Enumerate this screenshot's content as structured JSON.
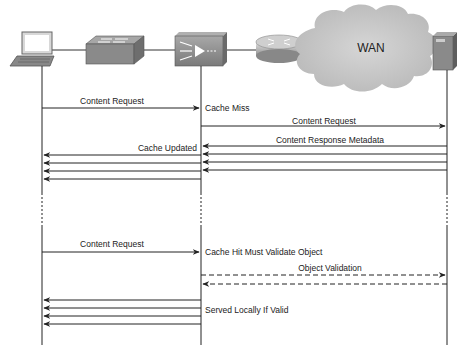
{
  "diagram": {
    "title": "",
    "devices": [
      {
        "id": "laptop",
        "type": "laptop",
        "label": ""
      },
      {
        "id": "switch",
        "type": "switch",
        "label": ""
      },
      {
        "id": "cache-engine",
        "type": "content-engine",
        "label": ""
      },
      {
        "id": "router",
        "type": "router",
        "label": ""
      },
      {
        "id": "wan",
        "type": "cloud",
        "label": "WAN"
      },
      {
        "id": "server",
        "type": "server",
        "label": ""
      }
    ],
    "messages": {
      "m1": "Content Request",
      "m1_note": "Cache Miss",
      "m2": "Content Request",
      "m3": "Content Response Metadata",
      "m4_note": "Cache Updated",
      "m5": "Content Request",
      "m5_note": "Cache Hit Must Validate Object",
      "m6": "Object Validation",
      "m7_note": "Served Locally If Valid"
    },
    "colors": {
      "device_gray": "#8a8a8a",
      "cloud": "#c8c8c8",
      "line": "#222222"
    }
  }
}
